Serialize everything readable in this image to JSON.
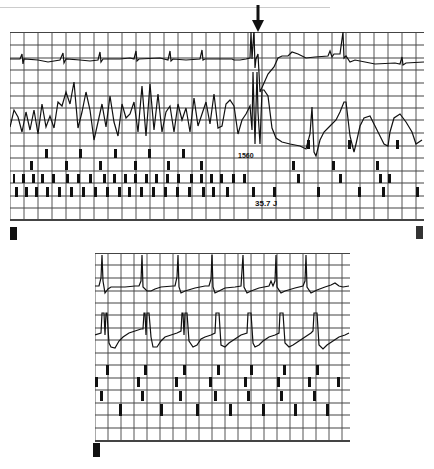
{
  "figure": {
    "panel_a": {
      "label": "A",
      "arrow_marker": "down-arrow",
      "annotations": {
        "interval": "1560",
        "energy": "35.7 J"
      },
      "channels": [
        "atrial-egm",
        "ventricular-egm",
        "atrial-markers",
        "ventricular-markers"
      ]
    },
    "panel_b": {
      "label": "B",
      "channels": [
        "atrial-egm",
        "ventricular-egm",
        "atrial-markers",
        "ventricular-markers"
      ]
    },
    "colors": {
      "ink": "#111111",
      "grid": "#444444",
      "background": "#ffffff"
    }
  }
}
